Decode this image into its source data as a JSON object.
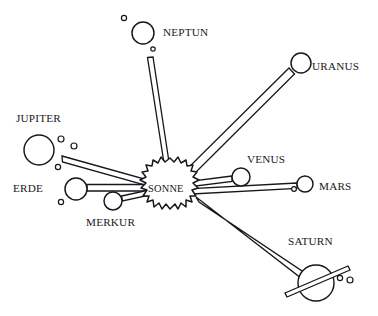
{
  "diagram": {
    "language": "de",
    "background_color": "#ffffff",
    "ink_color": "#17171c",
    "center": {
      "name": "sun",
      "label": "SONNE",
      "label_x": 148,
      "label_y": 192,
      "shape": "irregular-spiky-blob",
      "cx": 170,
      "cy": 188,
      "r": 30
    },
    "planets": [
      {
        "name": "neptun",
        "label": "NEPTUN",
        "label_x": 163,
        "label_y": 36,
        "cx": 143,
        "cy": 33,
        "r": 11,
        "moons": [
          {
            "cx": 124,
            "cy": 18,
            "r": 2.6
          },
          {
            "cx": 153,
            "cy": 49,
            "r": 2.2
          }
        ],
        "rod": {
          "from_x": 150,
          "from_y": 57,
          "to_x": 166,
          "to_y": 162,
          "width": 5
        }
      },
      {
        "name": "uranus",
        "label": "URANUS",
        "label_x": 312,
        "label_y": 70,
        "cx": 301,
        "cy": 63,
        "r": 10,
        "moons": [],
        "rod": {
          "from_x": 292,
          "from_y": 71,
          "to_x": 189,
          "to_y": 172,
          "width": 5
        }
      },
      {
        "name": "jupiter",
        "label": "JUPITER",
        "label_x": 16,
        "label_y": 122,
        "cx": 39,
        "cy": 150,
        "r": 15,
        "moons": [
          {
            "cx": 61,
            "cy": 139,
            "r": 3.0
          },
          {
            "cx": 74,
            "cy": 146,
            "r": 3.0
          },
          {
            "cx": 58,
            "cy": 167,
            "r": 2.6
          }
        ],
        "rod": {
          "from_x": 62,
          "from_y": 159,
          "to_x": 147,
          "to_y": 183,
          "width": 5
        }
      },
      {
        "name": "erde",
        "label": "ERDE",
        "label_x": 13,
        "label_y": 192,
        "cx": 76,
        "cy": 189,
        "r": 11,
        "moons": [
          {
            "cx": 61,
            "cy": 202,
            "r": 2.6
          }
        ],
        "rod": {
          "from_x": 88,
          "from_y": 188,
          "to_x": 144,
          "to_y": 188,
          "width": 6
        }
      },
      {
        "name": "merkur",
        "label": "MERKUR",
        "label_x": 86,
        "label_y": 226,
        "cx": 113,
        "cy": 201,
        "r": 9,
        "moons": [],
        "rod": {
          "from_x": 122,
          "from_y": 199,
          "to_x": 148,
          "to_y": 193,
          "width": 5
        }
      },
      {
        "name": "venus",
        "label": "VENUS",
        "label_x": 247,
        "label_y": 163,
        "cx": 241,
        "cy": 177,
        "r": 9,
        "moons": [],
        "rod": {
          "from_x": 232,
          "from_y": 179,
          "to_x": 192,
          "to_y": 184,
          "width": 5
        }
      },
      {
        "name": "mars",
        "label": "MARS",
        "label_x": 319,
        "label_y": 190,
        "cx": 305,
        "cy": 184,
        "r": 8,
        "moons": [
          {
            "cx": 294,
            "cy": 189,
            "r": 2.4
          }
        ],
        "rod": {
          "from_x": 296,
          "from_y": 186,
          "to_x": 192,
          "to_y": 191,
          "width": 5
        }
      },
      {
        "name": "saturn",
        "label": "SATURN",
        "label_x": 288,
        "label_y": 245,
        "cx": 316,
        "cy": 283,
        "r": 18,
        "moons": [
          {
            "cx": 340,
            "cy": 278,
            "r": 2.6
          },
          {
            "cx": 350,
            "cy": 280,
            "r": 3.0
          }
        ],
        "ring": {
          "from_x": 286,
          "from_y": 295,
          "to_x": 350,
          "to_y": 268,
          "width": 5
        },
        "rod": {
          "from_x": 300,
          "from_y": 270,
          "to_x": 194,
          "to_y": 201,
          "width": 5
        }
      }
    ]
  }
}
